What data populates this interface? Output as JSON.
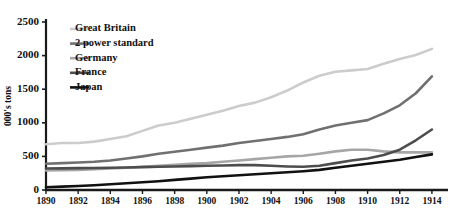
{
  "chart_data": {
    "type": "line",
    "title": "",
    "xlabel": "",
    "ylabel": "000's tons",
    "xlim": [
      1890,
      1915
    ],
    "ylim": [
      0,
      2500
    ],
    "grid": false,
    "legend_position": "top-left",
    "x_ticks": [
      "1890",
      "1892",
      "1894",
      "1896",
      "1898",
      "1900",
      "1902",
      "1904",
      "1906",
      "1908",
      "1910",
      "1912",
      "1914"
    ],
    "y_ticks": [
      "0",
      "500",
      "1000",
      "1500",
      "2000",
      "2500"
    ],
    "x": [
      1890,
      1891,
      1892,
      1893,
      1894,
      1895,
      1896,
      1897,
      1898,
      1899,
      1900,
      1901,
      1902,
      1903,
      1904,
      1905,
      1906,
      1907,
      1908,
      1909,
      1910,
      1911,
      1912,
      1913,
      1914
    ],
    "series": [
      {
        "name": "Great Britain",
        "color": "#cccccc",
        "width": 2.6,
        "values": [
          680,
          700,
          700,
          720,
          760,
          800,
          880,
          960,
          1000,
          1060,
          1120,
          1180,
          1250,
          1300,
          1380,
          1480,
          1600,
          1700,
          1760,
          1780,
          1800,
          1880,
          1950,
          2010,
          2100
        ]
      },
      {
        "name": "2 power standard",
        "color": "#707070",
        "width": 2.6,
        "values": [
          390,
          400,
          410,
          420,
          440,
          470,
          500,
          540,
          570,
          600,
          630,
          660,
          700,
          730,
          760,
          790,
          830,
          900,
          960,
          1000,
          1040,
          1140,
          1260,
          1440,
          1690
        ]
      },
      {
        "name": "Germany",
        "color": "#a6a6a6",
        "width": 2.6,
        "values": [
          290,
          295,
          300,
          310,
          320,
          330,
          345,
          360,
          375,
          390,
          400,
          420,
          440,
          460,
          480,
          500,
          510,
          540,
          575,
          600,
          600,
          575,
          560,
          560,
          560
        ]
      },
      {
        "name": "France",
        "color": "#4d4d4d",
        "width": 2.6,
        "values": [
          320,
          322,
          325,
          328,
          330,
          335,
          340,
          345,
          350,
          355,
          360,
          365,
          370,
          370,
          360,
          350,
          345,
          360,
          400,
          440,
          470,
          520,
          600,
          740,
          900
        ]
      },
      {
        "name": "Japan",
        "color": "#111111",
        "width": 2.6,
        "values": [
          40,
          50,
          60,
          70,
          85,
          100,
          115,
          130,
          150,
          170,
          190,
          205,
          220,
          235,
          250,
          265,
          280,
          300,
          330,
          360,
          390,
          420,
          450,
          490,
          530
        ]
      }
    ]
  },
  "legend": {
    "items": [
      {
        "label": "Great Britain"
      },
      {
        "label": "2 power standard"
      },
      {
        "label": "Germany"
      },
      {
        "label": "France"
      },
      {
        "label": "Japan"
      }
    ]
  }
}
